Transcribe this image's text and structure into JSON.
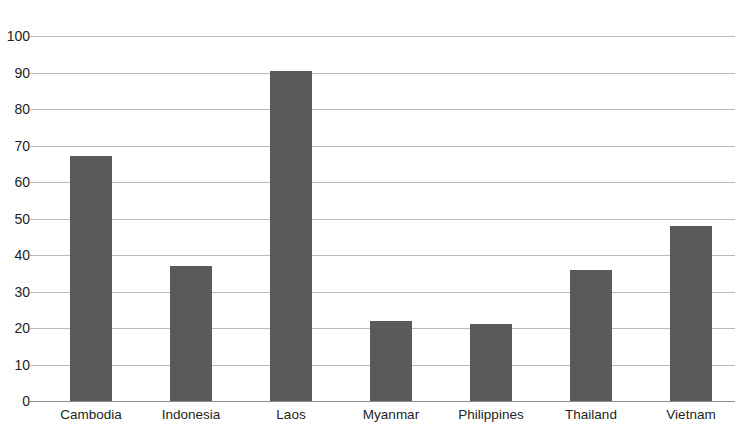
{
  "chart_data": {
    "type": "bar",
    "title": "",
    "subtitle": "",
    "xlabel": "",
    "ylabel": "",
    "categories": [
      "Cambodia",
      "Indonesia",
      "Laos",
      "Myanmar",
      "Philippines",
      "Thailand",
      "Vietnam"
    ],
    "values": [
      67,
      37,
      90.5,
      22,
      21,
      36,
      48
    ],
    "ylim": [
      0,
      100
    ],
    "ytick_step": 10,
    "ytick_labels": [
      "0",
      "10",
      "20",
      "30",
      "40",
      "50",
      "60",
      "70",
      "80",
      "90",
      "100"
    ],
    "grid": true,
    "grid_axis": "y",
    "legend": false,
    "legend_position": "none",
    "bar_color": "#5a5a5a",
    "gridline_color": "#b9b9b9",
    "axis_color": "#8e8e8e",
    "background_color": "#ffffff",
    "text_color": "#231f20",
    "annotations": []
  }
}
